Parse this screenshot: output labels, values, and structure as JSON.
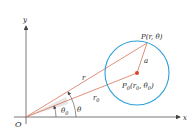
{
  "diagram": {
    "type": "polar-coordinate-circle",
    "colors": {
      "axis": "#555555",
      "radius_line": "#d9735a",
      "circle": "#2a9fd6",
      "center_point": "#d9452b",
      "angle_fill": "#e6e6e6",
      "text": "#222222"
    },
    "axes": {
      "x_label": "x",
      "y_label": "y",
      "origin_label": "O"
    },
    "points": {
      "P": {
        "label_main": "P(r, θ)"
      },
      "P0": {
        "label_P": "P",
        "label_sub0": "0",
        "label_rest": "(r",
        "label_sub1": "0",
        "label_mid": ", θ",
        "label_sub2": "0",
        "label_end": ")"
      }
    },
    "segments": {
      "r_label": "r",
      "r0_label": "r",
      "r0_sub": "0",
      "a_label": "a"
    },
    "angles": {
      "theta_label": "θ",
      "theta0_label": "θ",
      "theta0_sub": "0"
    }
  }
}
